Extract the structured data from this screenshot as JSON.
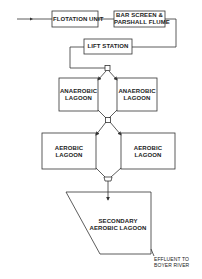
{
  "diagram": {
    "nodes": {
      "flotation_unit": {
        "label": "FLOTATION UNIT"
      },
      "bar_screen": {
        "line1": "BAR SCREEN &",
        "line2": "PARSHALL FLUME"
      },
      "lift_station": {
        "label": "LIFT STATION"
      },
      "anaerobic_left": {
        "line1": "ANAEROBIC",
        "line2": "LAGOON"
      },
      "anaerobic_right": {
        "line1": "ANAEROBIC",
        "line2": "LAGOON"
      },
      "aerobic_left": {
        "line1": "AEROBIC",
        "line2": "LAGOON"
      },
      "aerobic_right": {
        "line1": "AEROBIC",
        "line2": "LAGOON"
      },
      "secondary": {
        "line1": "SECONDARY",
        "line2": "AEROBIC LAGOON"
      }
    },
    "effluent": {
      "line1": "EFFLUENT TO",
      "line2": "BOYER RIVER"
    },
    "colors": {
      "stroke": "#333333",
      "background": "#ffffff"
    }
  }
}
